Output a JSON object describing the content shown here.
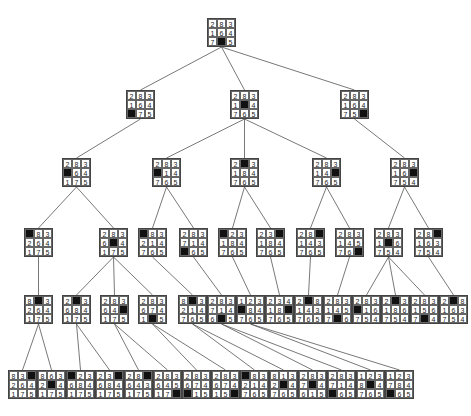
{
  "colors": {
    "blank_tile": "#111111",
    "line": "#555555",
    "border": "#444444"
  },
  "chart_data": {
    "type": "tree",
    "nodes": [
      {
        "id": "n0",
        "x": 207,
        "y": 18,
        "grid": [
          "2",
          "8",
          "3",
          "1",
          "6",
          "4",
          "7",
          "_",
          "5"
        ],
        "parent": null
      },
      {
        "id": "n1",
        "x": 126,
        "y": 90,
        "grid": [
          "2",
          "8",
          "3",
          "1",
          "6",
          "4",
          "_",
          "7",
          "5"
        ],
        "parent": "n0"
      },
      {
        "id": "n2",
        "x": 230,
        "y": 90,
        "grid": [
          "2",
          "8",
          "3",
          "1",
          "_",
          "4",
          "7",
          "6",
          "5"
        ],
        "parent": "n0"
      },
      {
        "id": "n3",
        "x": 340,
        "y": 90,
        "grid": [
          "2",
          "8",
          "3",
          "1",
          "6",
          "4",
          "7",
          "5",
          "_"
        ],
        "parent": "n0"
      },
      {
        "id": "n4",
        "x": 62,
        "y": 158,
        "grid": [
          "2",
          "8",
          "3",
          "_",
          "6",
          "4",
          "1",
          "7",
          "5"
        ],
        "parent": "n1"
      },
      {
        "id": "n5",
        "x": 152,
        "y": 158,
        "grid": [
          "2",
          "8",
          "3",
          "_",
          "1",
          "4",
          "7",
          "6",
          "5"
        ],
        "parent": "n2"
      },
      {
        "id": "n6",
        "x": 230,
        "y": 158,
        "grid": [
          "2",
          "_",
          "3",
          "1",
          "8",
          "4",
          "7",
          "6",
          "5"
        ],
        "parent": "n2"
      },
      {
        "id": "n7",
        "x": 312,
        "y": 158,
        "grid": [
          "2",
          "8",
          "3",
          "1",
          "4",
          "_",
          "7",
          "6",
          "5"
        ],
        "parent": "n2"
      },
      {
        "id": "n8",
        "x": 390,
        "y": 158,
        "grid": [
          "2",
          "8",
          "3",
          "1",
          "6",
          "_",
          "7",
          "5",
          "4"
        ],
        "parent": "n3"
      },
      {
        "id": "n9",
        "x": 24,
        "y": 228,
        "grid": [
          "_",
          "8",
          "3",
          "2",
          "6",
          "4",
          "1",
          "7",
          "5"
        ],
        "parent": "n4"
      },
      {
        "id": "n10",
        "x": 99,
        "y": 228,
        "grid": [
          "2",
          "8",
          "3",
          "6",
          "_",
          "4",
          "1",
          "7",
          "5"
        ],
        "parent": "n4"
      },
      {
        "id": "n11",
        "x": 138,
        "y": 228,
        "grid": [
          "_",
          "8",
          "3",
          "2",
          "1",
          "4",
          "7",
          "6",
          "5"
        ],
        "parent": "n5"
      },
      {
        "id": "n12",
        "x": 179,
        "y": 228,
        "grid": [
          "2",
          "8",
          "3",
          "7",
          "1",
          "4",
          "_",
          "6",
          "5"
        ],
        "parent": "n5"
      },
      {
        "id": "n13",
        "x": 218,
        "y": 228,
        "grid": [
          "_",
          "2",
          "3",
          "1",
          "8",
          "4",
          "7",
          "6",
          "5"
        ],
        "parent": "n6"
      },
      {
        "id": "n14",
        "x": 256,
        "y": 228,
        "grid": [
          "2",
          "3",
          "_",
          "1",
          "8",
          "4",
          "7",
          "6",
          "5"
        ],
        "parent": "n6"
      },
      {
        "id": "n15",
        "x": 296,
        "y": 228,
        "grid": [
          "2",
          "8",
          "_",
          "1",
          "4",
          "3",
          "7",
          "6",
          "5"
        ],
        "parent": "n7"
      },
      {
        "id": "n16",
        "x": 335,
        "y": 228,
        "grid": [
          "2",
          "8",
          "3",
          "1",
          "4",
          "5",
          "7",
          "6",
          "_"
        ],
        "parent": "n7"
      },
      {
        "id": "n17",
        "x": 374,
        "y": 228,
        "grid": [
          "2",
          "8",
          "3",
          "1",
          "_",
          "6",
          "7",
          "5",
          "4"
        ],
        "parent": "n8"
      },
      {
        "id": "n18",
        "x": 414,
        "y": 228,
        "grid": [
          "2",
          "8",
          "_",
          "1",
          "6",
          "3",
          "7",
          "5",
          "4"
        ],
        "parent": "n8"
      },
      {
        "id": "n19",
        "x": 24,
        "y": 295,
        "grid": [
          "8",
          "_",
          "3",
          "2",
          "6",
          "4",
          "1",
          "7",
          "5"
        ],
        "parent": "n9"
      },
      {
        "id": "n20",
        "x": 62,
        "y": 295,
        "grid": [
          "2",
          "_",
          "3",
          "6",
          "8",
          "4",
          "1",
          "7",
          "5"
        ],
        "parent": "n10"
      },
      {
        "id": "n21",
        "x": 100,
        "y": 295,
        "grid": [
          "2",
          "8",
          "3",
          "6",
          "4",
          "_",
          "1",
          "7",
          "5"
        ],
        "parent": "n10"
      },
      {
        "id": "n22",
        "x": 138,
        "y": 295,
        "grid": [
          "2",
          "8",
          "3",
          "6",
          "7",
          "4",
          "1",
          "_",
          "5"
        ],
        "parent": "n10"
      },
      {
        "id": "n23",
        "x": 178,
        "y": 295,
        "grid": [
          "8",
          "_",
          "3",
          "2",
          "1",
          "4",
          "7",
          "6",
          "5"
        ],
        "parent": "n11"
      },
      {
        "id": "n24",
        "x": 207,
        "y": 295,
        "grid": [
          "2",
          "8",
          "3",
          "7",
          "1",
          "4",
          "6",
          "_",
          "5"
        ],
        "parent": "n12"
      },
      {
        "id": "n25",
        "x": 236,
        "y": 295,
        "grid": [
          "1",
          "2",
          "3",
          "_",
          "8",
          "4",
          "7",
          "6",
          "5"
        ],
        "parent": "n13"
      },
      {
        "id": "n26",
        "x": 265,
        "y": 295,
        "grid": [
          "2",
          "3",
          "4",
          "1",
          "8",
          "_",
          "7",
          "6",
          "5"
        ],
        "parent": "n14"
      },
      {
        "id": "n27",
        "x": 294,
        "y": 295,
        "grid": [
          "2",
          "_",
          "8",
          "1",
          "4",
          "3",
          "7",
          "6",
          "5"
        ],
        "parent": "n15"
      },
      {
        "id": "n28",
        "x": 323,
        "y": 295,
        "grid": [
          "2",
          "8",
          "3",
          "1",
          "4",
          "5",
          "7",
          "_",
          "6"
        ],
        "parent": "n16"
      },
      {
        "id": "n29",
        "x": 352,
        "y": 295,
        "grid": [
          "2",
          "8",
          "3",
          "_",
          "1",
          "6",
          "7",
          "5",
          "4"
        ],
        "parent": "n17"
      },
      {
        "id": "n30",
        "x": 381,
        "y": 295,
        "grid": [
          "2",
          "_",
          "3",
          "1",
          "8",
          "6",
          "7",
          "5",
          "4"
        ],
        "parent": "n17"
      },
      {
        "id": "n31",
        "x": 410,
        "y": 295,
        "grid": [
          "2",
          "8",
          "3",
          "1",
          "5",
          "6",
          "7",
          "_",
          "4"
        ],
        "parent": "n17"
      },
      {
        "id": "n32",
        "x": 439,
        "y": 295,
        "grid": [
          "2",
          "_",
          "8",
          "1",
          "6",
          "3",
          "7",
          "5",
          "4"
        ],
        "parent": "n18"
      },
      {
        "id": "n33",
        "x": 8,
        "y": 370,
        "grid": [
          "8",
          "3",
          "_",
          "2",
          "6",
          "4",
          "1",
          "7",
          "5"
        ],
        "parent": "n19"
      },
      {
        "id": "n34",
        "x": 37,
        "y": 370,
        "grid": [
          "8",
          "6",
          "3",
          "2",
          "_",
          "4",
          "1",
          "7",
          "5"
        ],
        "parent": "n19"
      },
      {
        "id": "n35",
        "x": 66,
        "y": 370,
        "grid": [
          "_",
          "2",
          "3",
          "6",
          "8",
          "4",
          "1",
          "7",
          "5"
        ],
        "parent": "n20"
      },
      {
        "id": "n36",
        "x": 95,
        "y": 370,
        "grid": [
          "2",
          "3",
          "_",
          "6",
          "8",
          "4",
          "1",
          "7",
          "5"
        ],
        "parent": "n20"
      },
      {
        "id": "n37",
        "x": 124,
        "y": 370,
        "grid": [
          "2",
          "8",
          "_",
          "6",
          "4",
          "3",
          "1",
          "7",
          "5"
        ],
        "parent": "n21"
      },
      {
        "id": "n38",
        "x": 153,
        "y": 370,
        "grid": [
          "2",
          "8",
          "3",
          "6",
          "4",
          "5",
          "1",
          "7",
          "_"
        ],
        "parent": "n21"
      },
      {
        "id": "n39",
        "x": 182,
        "y": 370,
        "grid": [
          "2",
          "8",
          "3",
          "6",
          "7",
          "4",
          "_",
          "1",
          "5"
        ],
        "parent": "n22"
      },
      {
        "id": "n40",
        "x": 211,
        "y": 370,
        "grid": [
          "2",
          "8",
          "3",
          "6",
          "7",
          "4",
          "1",
          "5",
          "_"
        ],
        "parent": "n22"
      },
      {
        "id": "n41",
        "x": 240,
        "y": 370,
        "grid": [
          "_",
          "8",
          "3",
          "2",
          "1",
          "4",
          "7",
          "6",
          "5"
        ],
        "parent": "n23"
      },
      {
        "id": "n42",
        "x": 269,
        "y": 370,
        "grid": [
          "8",
          "1",
          "3",
          "2",
          "_",
          "4",
          "7",
          "6",
          "5"
        ],
        "parent": "n23"
      },
      {
        "id": "n43",
        "x": 298,
        "y": 370,
        "grid": [
          "2",
          "8",
          "3",
          "7",
          "_",
          "4",
          "6",
          "1",
          "5"
        ],
        "parent": "n24"
      },
      {
        "id": "n44",
        "x": 327,
        "y": 370,
        "grid": [
          "2",
          "8",
          "3",
          "7",
          "1",
          "4",
          "_",
          "6",
          "5"
        ],
        "parent": "n24"
      },
      {
        "id": "n45",
        "x": 356,
        "y": 370,
        "grid": [
          "1",
          "2",
          "3",
          "8",
          "_",
          "4",
          "7",
          "6",
          "5"
        ],
        "parent": "n25"
      },
      {
        "id": "n46",
        "x": 385,
        "y": 370,
        "grid": [
          "1",
          "2",
          "3",
          "7",
          "8",
          "4",
          "_",
          "6",
          "5"
        ],
        "parent": "n25"
      }
    ]
  }
}
